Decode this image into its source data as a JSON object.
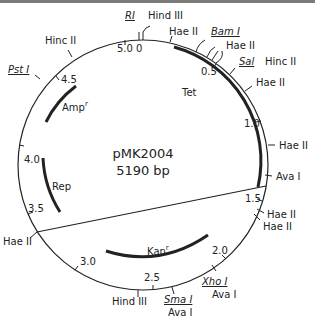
{
  "plasmid": {
    "name": "pMK2004",
    "size_label": "5190 bp",
    "size_bp": 5190
  },
  "scale_ticks": [
    {
      "kb": 0.0,
      "label": "5.0 0"
    },
    {
      "kb": 0.5,
      "label": "0.5"
    },
    {
      "kb": 1.0,
      "label": "1.0"
    },
    {
      "kb": 1.5,
      "label": "1.5"
    },
    {
      "kb": 2.0,
      "label": "2.0"
    },
    {
      "kb": 2.5,
      "label": "2.5"
    },
    {
      "kb": 3.0,
      "label": "3.0"
    },
    {
      "kb": 3.5,
      "label": "3.5"
    },
    {
      "kb": 4.0,
      "label": "4.0"
    },
    {
      "kb": 4.5,
      "label": "4.5"
    }
  ],
  "sites": [
    {
      "name": "RI",
      "underline": true,
      "italic": true
    },
    {
      "name": "Hind III"
    },
    {
      "name": "Hae II"
    },
    {
      "name": "Bam I",
      "underline": true,
      "italic": true
    },
    {
      "name": "Hae II"
    },
    {
      "name": "Sal",
      "underline": true,
      "italic": true
    },
    {
      "name": "Hinc II"
    },
    {
      "name": "Hae II"
    },
    {
      "name": "Hae II"
    },
    {
      "name": "Ava I"
    },
    {
      "name": "Hae II"
    },
    {
      "name": "Hae II"
    },
    {
      "name": "Xho I",
      "underline": true,
      "italic": true
    },
    {
      "name": "Ava I"
    },
    {
      "name": "Sma I",
      "underline": true,
      "italic": true
    },
    {
      "name": "Ava I"
    },
    {
      "name": "Hind III"
    },
    {
      "name": "Hae II"
    },
    {
      "name": "Pst I",
      "underline": true,
      "italic": true
    },
    {
      "name": "Hinc II"
    }
  ],
  "genes": [
    {
      "name": "Tet",
      "sup": ""
    },
    {
      "name": "Amp",
      "sup": "r"
    },
    {
      "name": "Rep",
      "sup": ""
    },
    {
      "name": "Kan",
      "sup": "r"
    }
  ]
}
